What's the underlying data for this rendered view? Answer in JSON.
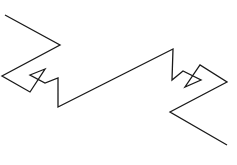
{
  "figure": {
    "background": "#ffffff",
    "stroke_color": "#1a1a1a",
    "stroke_width": 1.3,
    "path_points": [
      [
        5,
        15
      ],
      [
        60,
        45
      ],
      [
        2,
        76
      ],
      [
        30,
        92
      ],
      [
        45,
        69
      ],
      [
        30,
        75
      ],
      [
        45,
        83
      ],
      [
        58,
        78
      ],
      [
        58,
        107
      ],
      [
        173,
        49
      ],
      [
        172,
        80
      ],
      [
        183,
        71
      ],
      [
        201,
        80
      ],
      [
        185,
        87
      ],
      [
        200,
        65
      ],
      [
        227,
        82
      ],
      [
        170,
        112
      ],
      [
        227,
        145
      ]
    ]
  }
}
